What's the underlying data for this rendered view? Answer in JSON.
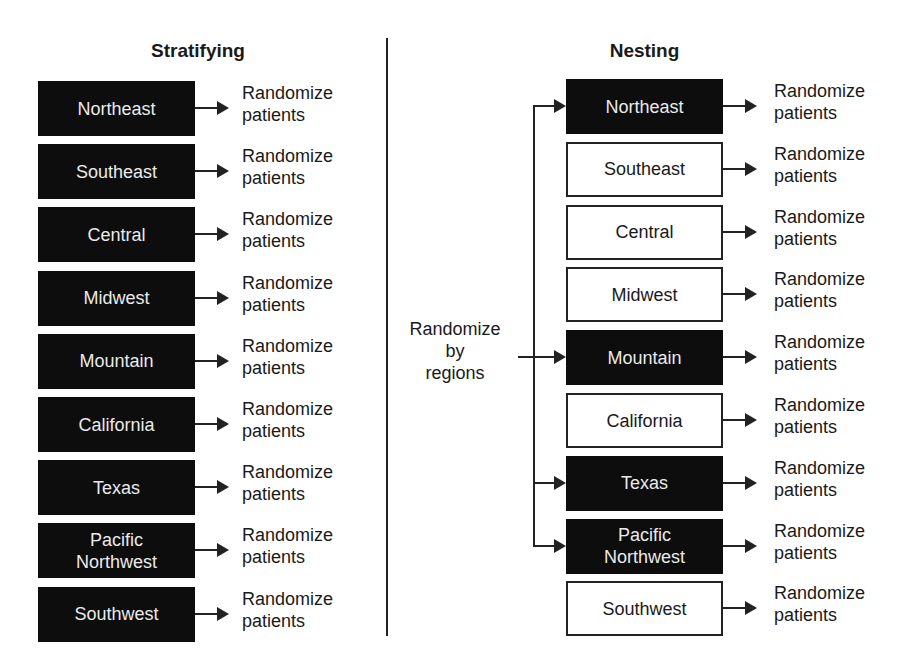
{
  "left": {
    "title": "Stratifying",
    "items": [
      {
        "label": "Northeast",
        "style": "dark",
        "outcome": [
          "Randomize",
          "patients"
        ]
      },
      {
        "label": "Southeast",
        "style": "dark",
        "outcome": [
          "Randomize",
          "patients"
        ]
      },
      {
        "label": "Central",
        "style": "dark",
        "outcome": [
          "Randomize",
          "patients"
        ]
      },
      {
        "label": "Midwest",
        "style": "dark",
        "outcome": [
          "Randomize",
          "patients"
        ]
      },
      {
        "label": "Mountain",
        "style": "dark",
        "outcome": [
          "Randomize",
          "patients"
        ]
      },
      {
        "label": "California",
        "style": "dark",
        "outcome": [
          "Randomize",
          "patients"
        ]
      },
      {
        "label": "Texas",
        "style": "dark",
        "outcome": [
          "Randomize",
          "patients"
        ]
      },
      {
        "label": "Pacific Northwest",
        "lines": [
          "Pacific",
          "Northwest"
        ],
        "style": "dark",
        "outcome": [
          "Randomize",
          "patients"
        ]
      },
      {
        "label": "Southwest",
        "style": "dark",
        "outcome": [
          "Randomize",
          "patients"
        ]
      }
    ]
  },
  "right": {
    "title": "Nesting",
    "source_label": [
      "Randomize",
      "by",
      "regions"
    ],
    "items": [
      {
        "label": "Northeast",
        "style": "dark",
        "selected": true,
        "outcome": [
          "Randomize",
          "patients"
        ]
      },
      {
        "label": "Southeast",
        "style": "light",
        "selected": false,
        "outcome": [
          "Randomize",
          "patients"
        ]
      },
      {
        "label": "Central",
        "style": "light",
        "selected": false,
        "outcome": [
          "Randomize",
          "patients"
        ]
      },
      {
        "label": "Midwest",
        "style": "light",
        "selected": false,
        "outcome": [
          "Randomize",
          "patients"
        ]
      },
      {
        "label": "Mountain",
        "style": "dark",
        "selected": true,
        "outcome": [
          "Randomize",
          "patients"
        ]
      },
      {
        "label": "California",
        "style": "light",
        "selected": false,
        "outcome": [
          "Randomize",
          "patients"
        ]
      },
      {
        "label": "Texas",
        "style": "dark",
        "selected": true,
        "outcome": [
          "Randomize",
          "patients"
        ]
      },
      {
        "label": "Pacific Northwest",
        "lines": [
          "Pacific",
          "Northwest"
        ],
        "style": "dark",
        "selected": true,
        "outcome": [
          "Randomize",
          "patients"
        ]
      },
      {
        "label": "Southwest",
        "style": "light",
        "selected": false,
        "outcome": [
          "Randomize",
          "patients"
        ]
      }
    ]
  },
  "colors": {
    "dark_box": "#0d0d0d",
    "dark_text": "#eaeaea",
    "line": "#222222"
  }
}
